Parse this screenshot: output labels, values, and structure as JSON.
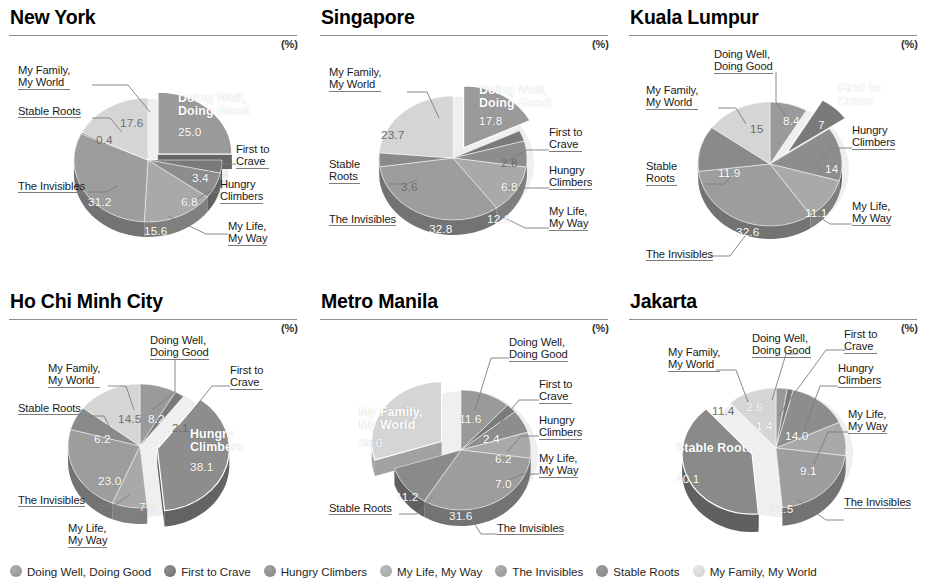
{
  "unit_label": "(%)",
  "segments": [
    {
      "key": "doing_well",
      "label": "Doing Well, Doing Good",
      "color": "#9a9a9a"
    },
    {
      "key": "first_crave",
      "label": "First to Crave",
      "color": "#7a7a7a"
    },
    {
      "key": "hungry",
      "label": "Hungry Climbers",
      "color": "#8d8d8d"
    },
    {
      "key": "my_life",
      "label": "My Life, My Way",
      "color": "#a9a9a9"
    },
    {
      "key": "invisibles",
      "label": "The Invisibles",
      "color": "#9d9d9d"
    },
    {
      "key": "stable",
      "label": "Stable Roots",
      "color": "#8a8a8a"
    },
    {
      "key": "family",
      "label": "My Family, My World",
      "color": "#d5d5d5"
    }
  ],
  "legend": {
    "items": [
      "Doing Well, Doing Good",
      "First to Crave",
      "Hungry Climbers",
      "My Life, My Way",
      "The Invisibles",
      "Stable Roots",
      "My Family, My World"
    ]
  },
  "chart_data": [
    {
      "type": "pie",
      "title": "New York",
      "unit": "(%)",
      "exploded": "Doing Well, Doing Good",
      "categories": [
        "Doing Well, Doing Good",
        "First to Crave",
        "Hungry Climbers",
        "My Life, My Way",
        "The Invisibles",
        "Stable Roots",
        "My Family, My World"
      ],
      "values": [
        25.0,
        3.4,
        6.8,
        15.6,
        31.2,
        0.4,
        17.6
      ],
      "value_labels": [
        "25.0",
        "3.4",
        "6.8",
        "15.6",
        "31.2",
        "0.4",
        "17.6"
      ]
    },
    {
      "type": "pie",
      "title": "Singapore",
      "unit": "(%)",
      "exploded": "Doing Well, Doing Good",
      "categories": [
        "Doing Well, Doing Good",
        "First to Crave",
        "Hungry Climbers",
        "My Life, My Way",
        "The Invisibles",
        "Stable Roots",
        "My Family, My World"
      ],
      "values": [
        17.8,
        2.8,
        6.8,
        12.6,
        32.8,
        3.6,
        23.7
      ],
      "value_labels": [
        "17.8",
        "2.8",
        "6.8",
        "12.6",
        "32.8",
        "3.6",
        "23.7"
      ]
    },
    {
      "type": "pie",
      "title": "Kuala Lumpur",
      "unit": "(%)",
      "exploded": "First to Crave",
      "categories": [
        "Doing Well, Doing Good",
        "First to Crave",
        "Hungry Climbers",
        "My Life, My Way",
        "The Invisibles",
        "Stable Roots",
        "My Family, My World"
      ],
      "values": [
        8.4,
        7.0,
        14.0,
        11.1,
        32.6,
        11.9,
        15.0
      ],
      "value_labels": [
        "8.4",
        "7",
        "14",
        "11.1",
        "32.6",
        "11.9",
        "15"
      ]
    },
    {
      "type": "pie",
      "title": "Ho Chi Minh City",
      "unit": "(%)",
      "exploded": "Hungry Climbers",
      "categories": [
        "Doing Well, Doing Good",
        "First to Crave",
        "Hungry Climbers",
        "My Life, My Way",
        "The Invisibles",
        "Stable Roots",
        "My Family, My World"
      ],
      "values": [
        8.2,
        2.1,
        38.1,
        7.9,
        23.0,
        6.2,
        14.5
      ],
      "value_labels": [
        "8.2",
        "2.1",
        "38.1",
        "7.9",
        "23.0",
        "6.2",
        "14.5"
      ]
    },
    {
      "type": "pie",
      "title": "Metro Manila",
      "unit": "(%)",
      "exploded": "My Family, My World",
      "categories": [
        "Doing Well, Doing Good",
        "First to Crave",
        "Hungry Climbers",
        "My Life, My Way",
        "The Invisibles",
        "Stable Roots",
        "My Family, My World"
      ],
      "values": [
        11.6,
        2.4,
        6.2,
        7.0,
        31.6,
        11.2,
        30.0
      ],
      "value_labels": [
        "11.6",
        "2.4",
        "6.2",
        "7.0",
        "31.6",
        "11.2",
        "30.0"
      ]
    },
    {
      "type": "pie",
      "title": "Jakarta",
      "unit": "(%)",
      "exploded": "Stable Roots",
      "categories": [
        "Doing Well, Doing Good",
        "First to Crave",
        "Hungry Climbers",
        "My Life, My Way",
        "The Invisibles",
        "Stable Roots",
        "My Family, My World"
      ],
      "values": [
        2.6,
        1.4,
        14.0,
        9.1,
        21.5,
        40.1,
        11.4
      ],
      "value_labels": [
        "2.6",
        "1.4",
        "14.0",
        "9.1",
        "21.5",
        "40.1",
        "11.4"
      ]
    }
  ],
  "panels": {
    "new_york": {
      "title": "New York",
      "labels": {
        "family": "My Family,\nMy World",
        "stable": "Stable Roots",
        "invisibles": "The Invisibles",
        "doing_well": "Doing Well,\nDoing Good",
        "first_crave": "First to\nCrave",
        "hungry": "Hungry\nClimbers",
        "my_life": "My Life,\nMy Way"
      },
      "values": {
        "doing_well": "25.0",
        "first_crave": "3.4",
        "hungry": "6.8",
        "my_life": "15.6",
        "invisibles": "31.2",
        "stable": "0.4",
        "family": "17.6"
      }
    },
    "singapore": {
      "title": "Singapore",
      "labels": {
        "family": "My Family,\nMy World",
        "stable": "Stable\nRoots",
        "invisibles": "The Invisibles",
        "doing_well": "Doing Well,\nDoing Good",
        "first_crave": "First to\nCrave",
        "hungry": "Hungry\nClimbers",
        "my_life": "My Life,\nMy Way"
      },
      "values": {
        "doing_well": "17.8",
        "first_crave": "2.8",
        "hungry": "6.8",
        "my_life": "12.6",
        "invisibles": "32.8",
        "stable": "3.6",
        "family": "23.7"
      }
    },
    "kuala_lumpur": {
      "title": "Kuala Lumpur",
      "labels": {
        "family": "My Family,\nMy World",
        "stable": "Stable\nRoots",
        "invisibles": "The Invisibles",
        "doing_well": "Doing Well,\nDoing Good",
        "first_crave": "First to\nCrave",
        "hungry": "Hungry\nClimbers",
        "my_life": "My Life,\nMy Way"
      },
      "values": {
        "doing_well": "8.4",
        "first_crave": "7",
        "hungry": "14",
        "my_life": "11.1",
        "invisibles": "32.6",
        "stable": "11.9",
        "family": "15"
      }
    },
    "ho_chi_minh": {
      "title": "Ho Chi Minh City",
      "labels": {
        "family": "My Family,\nMy World",
        "stable": "Stable Roots",
        "invisibles": "The Invisibles",
        "doing_well": "Doing Well,\nDoing Good",
        "first_crave": "First to\nCrave",
        "hungry": "Hungry\nClimbers",
        "my_life": "My Life,\nMy Way"
      },
      "values": {
        "doing_well": "8.2",
        "first_crave": "2.1",
        "hungry": "38.1",
        "my_life": "7.9",
        "invisibles": "23.0",
        "stable": "6.2",
        "family": "14.5"
      }
    },
    "metro_manila": {
      "title": "Metro Manila",
      "labels": {
        "family": "My Family,\nMy World",
        "stable": "Stable Roots",
        "invisibles": "The Invisibles",
        "doing_well": "Doing Well,\nDoing Good",
        "first_crave": "First to\nCrave",
        "hungry": "Hungry\nClimbers",
        "my_life": "My Life,\nMy Way"
      },
      "values": {
        "doing_well": "11.6",
        "first_crave": "2.4",
        "hungry": "6.2",
        "my_life": "7.0",
        "invisibles": "31.6",
        "stable": "11.2",
        "family": "30.0"
      }
    },
    "jakarta": {
      "title": "Jakarta",
      "labels": {
        "family": "My Family,\nMy World",
        "stable": "Stable Roots",
        "invisibles": "The Invisibles",
        "doing_well": "Doing Well,\nDoing Good",
        "first_crave": "First to\nCrave",
        "hungry": "Hungry\nClimbers",
        "my_life": "My Life,\nMy Way"
      },
      "values": {
        "doing_well": "2.6",
        "first_crave": "1.4",
        "hungry": "14.0",
        "my_life": "9.1",
        "invisibles": "21.5",
        "stable": "40.1",
        "family": "11.4"
      }
    }
  }
}
